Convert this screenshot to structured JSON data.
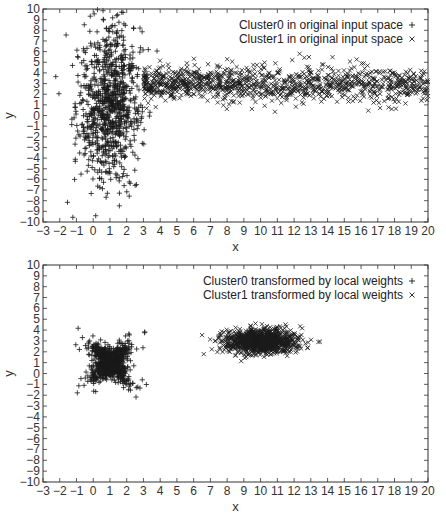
{
  "chart_data": [
    {
      "type": "scatter",
      "title": "",
      "xlabel": "x",
      "ylabel": "y",
      "xlim": [
        -3,
        20
      ],
      "ylim": [
        -10,
        10
      ],
      "xticks": [
        -3,
        -2,
        -1,
        0,
        1,
        2,
        3,
        4,
        5,
        6,
        7,
        8,
        9,
        10,
        11,
        12,
        13,
        14,
        15,
        16,
        17,
        18,
        19,
        20
      ],
      "yticks": [
        -10,
        -9,
        -8,
        -7,
        -6,
        -5,
        -4,
        -3,
        -2,
        -1,
        0,
        1,
        2,
        3,
        4,
        5,
        6,
        7,
        8,
        9,
        10
      ],
      "grid": false,
      "legend_position": "upper right",
      "series": [
        {
          "name": "Cluster0 in original input space",
          "marker": "+",
          "description": "dense vertical cloud centered near x≈1, spanning y≈-10..10",
          "approx_distribution": {
            "x_mean": 1.0,
            "x_sd": 1.0,
            "y_mean": 1.0,
            "y_sd": 3.8,
            "n": 900
          }
        },
        {
          "name": "Cluster1 in original input space",
          "marker": "×",
          "description": "horizontal band from x≈3 to x≈20 centered at y≈3",
          "approx_distribution": {
            "x_min": 3.0,
            "x_max": 20.0,
            "y_mean": 3.0,
            "y_sd": 0.8,
            "n": 1100
          }
        }
      ]
    },
    {
      "type": "scatter",
      "title": "",
      "xlabel": "x",
      "ylabel": "y",
      "xlim": [
        -3,
        20
      ],
      "ylim": [
        -10,
        10
      ],
      "xticks": [
        -3,
        -2,
        -1,
        0,
        1,
        2,
        3,
        4,
        5,
        6,
        7,
        8,
        9,
        10,
        11,
        12,
        13,
        14,
        15,
        16,
        17,
        18,
        19,
        20
      ],
      "yticks": [
        -10,
        -9,
        -8,
        -7,
        -6,
        -5,
        -4,
        -3,
        -2,
        -1,
        0,
        1,
        2,
        3,
        4,
        5,
        6,
        7,
        8,
        9,
        10
      ],
      "grid": false,
      "legend_position": "upper right",
      "series": [
        {
          "name": "Cluster0 transformed by local weights",
          "marker": "+",
          "description": "X-shaped (bow-tie) cluster centered at (1, 1), spanning x≈-2..3.5, y≈-1.5..3.5",
          "approx_distribution": {
            "x_mean": 1.0,
            "x_sd": 0.9,
            "y_mean": 1.0,
            "y_sd": 0.9,
            "n": 800
          }
        },
        {
          "name": "Cluster1 transformed by local weights",
          "marker": "×",
          "description": "compact elliptical cluster centered at (10, 3), spanning x≈6.5..13, y≈0..5",
          "approx_distribution": {
            "x_mean": 10.0,
            "x_sd": 1.3,
            "y_mean": 3.0,
            "y_sd": 0.6,
            "n": 1000
          }
        }
      ]
    }
  ],
  "plots": {
    "top": {
      "legend": [
        {
          "label": "Cluster0 in original input space",
          "marker": "+"
        },
        {
          "label": "Cluster1 in original input space",
          "marker": "×"
        }
      ],
      "xlabel": "x",
      "ylabel": "y"
    },
    "bottom": {
      "legend": [
        {
          "label": "Cluster0 transformed by local weights",
          "marker": "+"
        },
        {
          "label": "Cluster1 transformed by local weights",
          "marker": "×"
        }
      ],
      "xlabel": "x",
      "ylabel": "y"
    }
  },
  "colors": {
    "marker": "#1a1a1a",
    "axis": "#333333",
    "background": "#ffffff"
  }
}
